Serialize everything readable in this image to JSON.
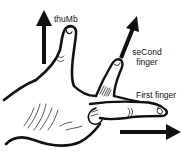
{
  "diagram": {
    "labels": {
      "thumb": "thuMb",
      "second_finger_line1": "seCond",
      "second_finger_line2": "finger",
      "first_finger": "First finger"
    },
    "arrows": [
      {
        "name": "thumb-arrow",
        "direction": "up"
      },
      {
        "name": "second-finger-arrow",
        "direction": "up-right"
      },
      {
        "name": "first-finger-arrow",
        "direction": "right"
      }
    ],
    "colors": {
      "ink": "#111111",
      "background": "#ffffff"
    }
  }
}
